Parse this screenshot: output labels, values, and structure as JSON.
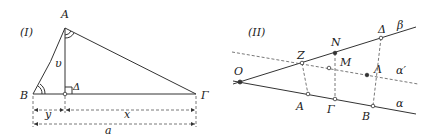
{
  "figure_I": {
    "tag": "(I)",
    "vertices": {
      "A": {
        "label": "A",
        "x": 65,
        "y": 28
      },
      "B": {
        "label": "B",
        "x": 33,
        "y": 94
      },
      "Delta": {
        "label": "Δ",
        "x": 65,
        "y": 94
      },
      "Gamma": {
        "label": "Γ",
        "x": 196,
        "y": 94
      }
    },
    "height_label": "υ",
    "dimensions": {
      "y": "y",
      "x": "x",
      "a": "a"
    }
  },
  "figure_II": {
    "tag": "(II)",
    "points": {
      "O": {
        "label": "O",
        "x": 240,
        "y": 82
      },
      "Z": {
        "label": "Z",
        "x": 302,
        "y": 63
      },
      "N": {
        "label": "N",
        "x": 335,
        "y": 53
      },
      "Delta": {
        "label": "Δ",
        "x": 381,
        "y": 38
      },
      "M": {
        "label": "M",
        "x": 329,
        "y": 68
      },
      "Lambda": {
        "label": "Λ",
        "x": 367,
        "y": 75
      },
      "A": {
        "label": "A",
        "x": 308,
        "y": 94
      },
      "Gamma": {
        "label": "Γ",
        "x": 335,
        "y": 99
      },
      "B": {
        "label": "B",
        "x": 373,
        "y": 106
      }
    },
    "lines": {
      "beta": "β",
      "alpha_prime": "α′",
      "alpha": "α"
    }
  }
}
